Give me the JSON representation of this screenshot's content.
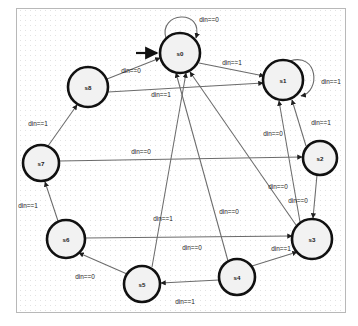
{
  "diagram": {
    "type": "state-machine",
    "background_color": "#ffffff",
    "grid_color": "#c9c9c9",
    "border_color": "#b8b8b8",
    "node_fill": "#f2f2f2",
    "node_stroke": "#111111",
    "edge_color": "#6b6b6b",
    "label_color": "#1c1c1c"
  },
  "states": [
    {
      "id": "s0",
      "label": "s0",
      "cx": 180,
      "cy": 53,
      "r": 20,
      "initial": true
    },
    {
      "id": "s1",
      "label": "s1",
      "cx": 283,
      "cy": 80,
      "r": 20,
      "initial": false
    },
    {
      "id": "s2",
      "label": "s2",
      "cx": 320,
      "cy": 158,
      "r": 17,
      "initial": false
    },
    {
      "id": "s3",
      "label": "s3",
      "cx": 312,
      "cy": 239,
      "r": 20,
      "initial": false
    },
    {
      "id": "s4",
      "label": "s4",
      "cx": 237,
      "cy": 277,
      "r": 18,
      "initial": false
    },
    {
      "id": "s5",
      "label": "s5",
      "cx": 142,
      "cy": 284,
      "r": 18,
      "initial": false
    },
    {
      "id": "s6",
      "label": "s6",
      "cx": 66,
      "cy": 239,
      "r": 19,
      "initial": false
    },
    {
      "id": "s7",
      "label": "s7",
      "cx": 41,
      "cy": 163,
      "r": 18,
      "initial": false
    },
    {
      "id": "s8",
      "label": "s8",
      "cx": 88,
      "cy": 87,
      "r": 20,
      "initial": false
    }
  ],
  "transitions": [
    {
      "id": "t0",
      "from": "s0",
      "to": "s0",
      "label": "din==0",
      "label_x": 209,
      "label_y": 19,
      "kind": "self-loop"
    },
    {
      "id": "t1",
      "from": "s0",
      "to": "s1",
      "label": "din==1",
      "label_x": 232,
      "label_y": 62,
      "kind": "edge"
    },
    {
      "id": "t2",
      "from": "s1",
      "to": "s1",
      "label": "din==1",
      "label_x": 331,
      "label_y": 81,
      "kind": "self-loop"
    },
    {
      "id": "t3",
      "from": "s1",
      "to": "s2",
      "label": "din==1",
      "label_x": 321,
      "label_y": 122,
      "kind": "edge"
    },
    {
      "id": "t4",
      "from": "s8",
      "to": "s0",
      "label": "din==0",
      "label_x": 131,
      "label_y": 70,
      "kind": "edge"
    },
    {
      "id": "t5",
      "from": "s8",
      "to": "s1",
      "label": "din==1",
      "label_x": 161,
      "label_y": 94,
      "kind": "edge"
    },
    {
      "id": "t6",
      "from": "s7",
      "to": "s8",
      "label": "din==1",
      "label_x": 38,
      "label_y": 123,
      "kind": "edge"
    },
    {
      "id": "t7",
      "from": "s7",
      "to": "s2",
      "label": "din==0",
      "label_x": 141,
      "label_y": 151,
      "kind": "edge"
    },
    {
      "id": "t8",
      "from": "s6",
      "to": "s7",
      "label": "din==1",
      "label_x": 28,
      "label_y": 205,
      "kind": "edge"
    },
    {
      "id": "t9",
      "from": "s6",
      "to": "s3",
      "label": "din==0",
      "label_x": 192,
      "label_y": 247,
      "kind": "edge"
    },
    {
      "id": "t10",
      "from": "s5",
      "to": "s6",
      "label": "din==0",
      "label_x": 85,
      "label_y": 276,
      "kind": "edge"
    },
    {
      "id": "t11",
      "from": "s4",
      "to": "s5",
      "label": "din==1",
      "label_x": 185,
      "label_y": 301,
      "kind": "edge"
    },
    {
      "id": "t12",
      "from": "s4",
      "to": "s3",
      "label": "din==1",
      "label_x": 281,
      "label_y": 248,
      "kind": "edge"
    },
    {
      "id": "t13",
      "from": "s2",
      "to": "s3",
      "label": "din==0",
      "label_x": 298,
      "label_y": 200,
      "kind": "edge"
    },
    {
      "id": "t14",
      "from": "s3",
      "to": "s1",
      "label": "din==0",
      "label_x": 273,
      "label_y": 133,
      "kind": "edge"
    },
    {
      "id": "t15",
      "from": "s3",
      "to": "s0",
      "label": "din==0",
      "label_x": 278,
      "label_y": 186,
      "kind": "edge"
    },
    {
      "id": "t16",
      "from": "s5",
      "to": "s0",
      "label": "din==0",
      "label_x": 229,
      "label_y": 211,
      "kind": "edge"
    },
    {
      "id": "t17",
      "from": "s4",
      "to": "s0",
      "label": "din==1",
      "label_x": 163,
      "label_y": 218,
      "kind": "edge"
    }
  ],
  "counts": {
    "state_count": 9,
    "transition_count": 18,
    "self_loop_count": 2
  },
  "signal": {
    "name": "din",
    "values": [
      "0",
      "1"
    ]
  }
}
